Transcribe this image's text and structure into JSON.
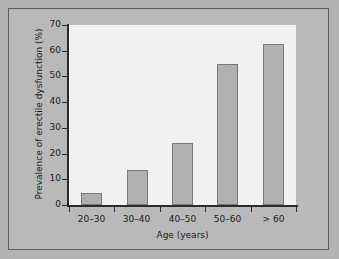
{
  "chart_data": {
    "type": "bar",
    "title": "",
    "categories": [
      "20–30",
      "30–40",
      "40–50",
      "50–60",
      "> 60"
    ],
    "values": [
      4.7,
      13.6,
      24,
      55,
      62.5
    ],
    "xlabel": "Age (years)",
    "ylabel": "Prevalence of erectile dysfunction (%)",
    "ylim": [
      0,
      70
    ],
    "yticks": [
      "0",
      "10",
      "20",
      "30",
      "40",
      "50",
      "60",
      "70"
    ],
    "ytick_values": [
      0,
      10,
      20,
      30,
      40,
      50,
      60,
      70
    ],
    "grid": false,
    "legend": "none",
    "colors": {
      "bar_fill": "#b0b0b0",
      "bar_edge": "#787878",
      "panel_background": "#f1f1ef",
      "figure_background": "#b9b9b9",
      "outer_background": "#b4b4b4",
      "frame_border": "#5e5e5e",
      "axis": "#2b2b2b",
      "text": "#1a1a1a"
    }
  }
}
